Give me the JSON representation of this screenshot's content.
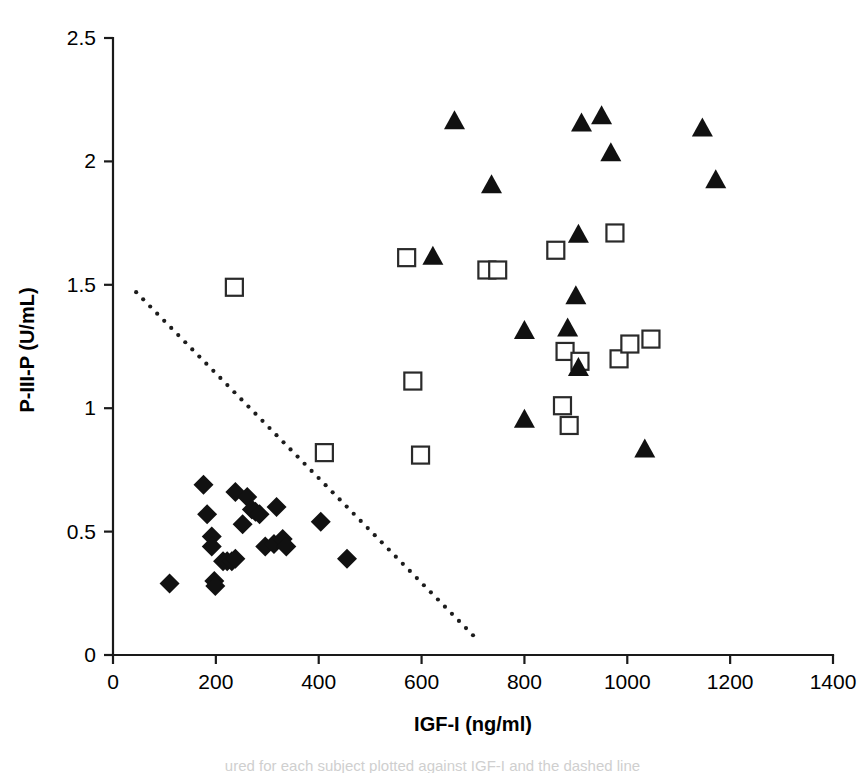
{
  "figure": {
    "background": "#ffffff",
    "marker_color": "#111111",
    "axis_color": "#1a1a1a",
    "caption_partial": "ured for each subject plotted against IGF-I and the dashed line"
  },
  "chart_data": {
    "type": "scatter",
    "title": "",
    "xlabel": "IGF-I (ng/ml)",
    "ylabel": "P-III-P (U/mL)",
    "xlim": [
      0,
      1400
    ],
    "ylim": [
      0,
      2.5
    ],
    "xticks": [
      0,
      200,
      400,
      600,
      800,
      1000,
      1200,
      1400
    ],
    "xtick_labels": [
      "0",
      "200",
      "400",
      "600",
      "800",
      "1000",
      "1200",
      "1400"
    ],
    "yticks": [
      0,
      0.5,
      1,
      1.5,
      2,
      2.5
    ],
    "ytick_labels": [
      "0",
      "0.5",
      "1",
      "1.5",
      "2",
      "2.5"
    ],
    "grid": false,
    "legend": "none",
    "series": [
      {
        "name": "filled-diamond",
        "marker": "diamond",
        "fill": "#111111",
        "points": [
          [
            110,
            0.29
          ],
          [
            176,
            0.69
          ],
          [
            183,
            0.57
          ],
          [
            192,
            0.48
          ],
          [
            192,
            0.44
          ],
          [
            197,
            0.3
          ],
          [
            199,
            0.28
          ],
          [
            214,
            0.38
          ],
          [
            222,
            0.38
          ],
          [
            231,
            0.38
          ],
          [
            238,
            0.66
          ],
          [
            238,
            0.39
          ],
          [
            252,
            0.53
          ],
          [
            261,
            0.64
          ],
          [
            270,
            0.59
          ],
          [
            277,
            0.58
          ],
          [
            285,
            0.57
          ],
          [
            296,
            0.44
          ],
          [
            313,
            0.45
          ],
          [
            318,
            0.6
          ],
          [
            330,
            0.47
          ],
          [
            337,
            0.44
          ],
          [
            404,
            0.54
          ],
          [
            455,
            0.39
          ]
        ]
      },
      {
        "name": "open-square",
        "marker": "square",
        "fill": "#ffffff",
        "points": [
          [
            236,
            1.49
          ],
          [
            411,
            0.82
          ],
          [
            571,
            1.61
          ],
          [
            583,
            1.11
          ],
          [
            598,
            0.81
          ],
          [
            727,
            1.56
          ],
          [
            748,
            1.56
          ],
          [
            861,
            1.64
          ],
          [
            874,
            1.01
          ],
          [
            879,
            1.23
          ],
          [
            887,
            0.93
          ],
          [
            908,
            1.19
          ],
          [
            976,
            1.71
          ],
          [
            984,
            1.2
          ],
          [
            1005,
            1.26
          ],
          [
            1046,
            1.28
          ]
        ]
      },
      {
        "name": "filled-triangle",
        "marker": "triangle",
        "fill": "#111111",
        "points": [
          [
            664,
            2.16
          ],
          [
            622,
            1.61
          ],
          [
            736,
            1.9
          ],
          [
            800,
            1.31
          ],
          [
            800,
            0.95
          ],
          [
            884,
            1.32
          ],
          [
            900,
            1.45
          ],
          [
            905,
            1.7
          ],
          [
            911,
            2.15
          ],
          [
            905,
            1.16
          ],
          [
            950,
            2.18
          ],
          [
            968,
            2.03
          ],
          [
            1034,
            0.83
          ],
          [
            1146,
            2.13
          ],
          [
            1172,
            1.92
          ]
        ]
      }
    ],
    "annotations": [
      {
        "name": "threshold-line",
        "style": "dotted",
        "from": [
          45,
          1.47
        ],
        "to": [
          700,
          0.08
        ]
      }
    ]
  }
}
